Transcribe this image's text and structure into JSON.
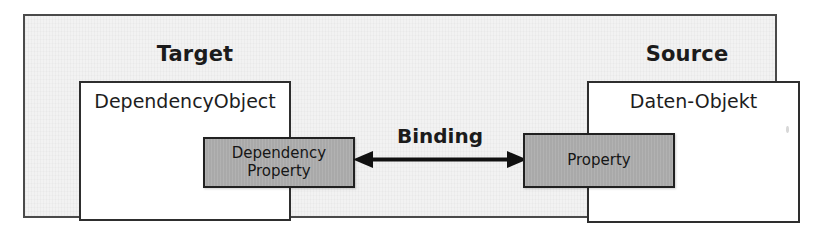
{
  "diagram": {
    "frame": {
      "border_color": "#4a4a4a",
      "background_color": "#f2f2f2"
    },
    "sections": [
      {
        "id": "target",
        "title": "Target",
        "object_box": {
          "label": "DependencyObject",
          "fill_color": "#ffffff",
          "border_color": "#2e2e2e"
        },
        "property_box": {
          "label": "Dependency\nProperty",
          "fill_color": "#a9a9a9",
          "border_color": "#212121"
        }
      },
      {
        "id": "source",
        "title": "Source",
        "object_box": {
          "label": "Daten-Objekt",
          "fill_color": "#ffffff",
          "border_color": "#2e2e2e"
        },
        "property_box": {
          "label": "Property",
          "fill_color": "#a9a9a9",
          "border_color": "#212121"
        }
      }
    ],
    "connector": {
      "label": "Binding",
      "style": "double-headed-arrow",
      "direction": "bidirectional",
      "color": "#111111"
    }
  }
}
